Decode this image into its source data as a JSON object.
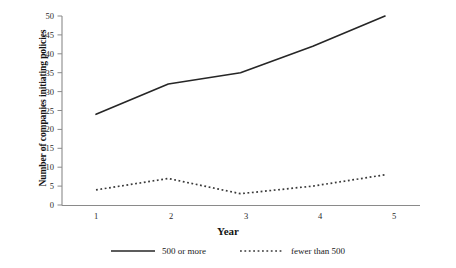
{
  "chart_data": {
    "type": "line",
    "title": "",
    "xlabel": "Year",
    "ylabel": "Number of companies initiating policies",
    "x": [
      1,
      2,
      3,
      4,
      5
    ],
    "xticklabels": [
      "1",
      "2",
      "3",
      "4",
      "5"
    ],
    "yticklabels": [
      "0",
      "5",
      "10",
      "15",
      "20",
      "25",
      "30",
      "35",
      "40",
      "45",
      "50"
    ],
    "yticks": [
      0,
      5,
      10,
      15,
      20,
      25,
      30,
      35,
      40,
      45,
      50
    ],
    "xlim": [
      0.6,
      5.4
    ],
    "ylim": [
      0,
      50
    ],
    "grid": false,
    "legend_position": "below",
    "series": [
      {
        "name": "500 or more",
        "style": "solid",
        "color": "#262626",
        "values": [
          24,
          32,
          35,
          42,
          50
        ]
      },
      {
        "name": "fewer than 500",
        "style": "dotted",
        "color": "#3a3a3a",
        "values": [
          4,
          7,
          3,
          5,
          8
        ]
      }
    ]
  },
  "axes": {
    "y_title": "Number of companies initiating policies",
    "x_title": "Year",
    "y_ticks": [
      {
        "label": "50"
      },
      {
        "label": "45"
      },
      {
        "label": "40"
      },
      {
        "label": "35"
      },
      {
        "label": "30"
      },
      {
        "label": "25"
      },
      {
        "label": "20"
      },
      {
        "label": "15"
      },
      {
        "label": "10"
      },
      {
        "label": "5"
      },
      {
        "label": "0"
      }
    ],
    "x_ticks": [
      {
        "label": "1"
      },
      {
        "label": "2"
      },
      {
        "label": "3"
      },
      {
        "label": "4"
      },
      {
        "label": "5"
      }
    ]
  },
  "legend": {
    "items": [
      {
        "label": "500 or more",
        "style": "solid"
      },
      {
        "label": "fewer than 500",
        "style": "dotted"
      }
    ]
  }
}
